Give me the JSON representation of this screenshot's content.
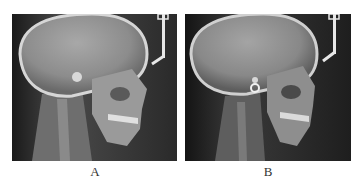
{
  "figure": {
    "panels": [
      {
        "id": "A",
        "label": "A",
        "content": "lateral cephalometric radiograph"
      },
      {
        "id": "B",
        "label": "B",
        "content": "lateral cephalometric radiograph"
      }
    ]
  }
}
